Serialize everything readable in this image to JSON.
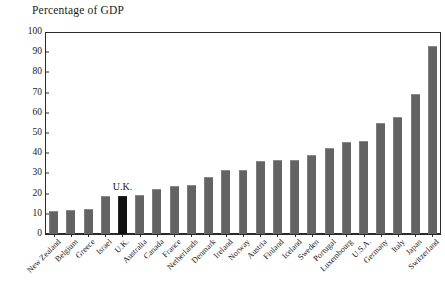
{
  "chart_data": {
    "type": "bar",
    "title": "Percentage of GDP",
    "xlabel": "",
    "ylabel": "",
    "ylim": [
      0,
      100
    ],
    "ytick_step": 10,
    "yticks": [
      0,
      10,
      20,
      30,
      40,
      50,
      60,
      70,
      80,
      90,
      100
    ],
    "grid": false,
    "legend": null,
    "categories": [
      "New Zealand",
      "Belgium",
      "Greece",
      "Israel",
      "U.K.",
      "Australia",
      "Canada",
      "France",
      "Netherlands",
      "Denmark",
      "Ireland",
      "Norway",
      "Austria",
      "Finland",
      "Iceland",
      "Sweden",
      "Portugal",
      "Luxembourg",
      "U.S.A.",
      "Germany",
      "Italy",
      "Japan",
      "Switzerland"
    ],
    "values": [
      11.5,
      12.0,
      12.3,
      18.8,
      18.8,
      19.5,
      22.5,
      24.0,
      24.5,
      28.0,
      31.5,
      31.5,
      36.3,
      36.5,
      36.7,
      39.0,
      42.8,
      45.7,
      46.2,
      55.0,
      57.7,
      69.4,
      93.2
    ],
    "highlight_index": 4,
    "annotations": [
      {
        "text": "U.K.",
        "category": "U.K."
      }
    ],
    "colors": {
      "bar": "#636363",
      "bar_highlight": "#101010",
      "axis": "#2b2b2b",
      "text": "#1a1a1a",
      "background": "#ffffff"
    }
  }
}
